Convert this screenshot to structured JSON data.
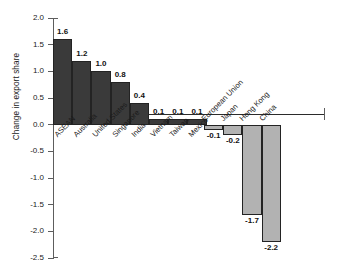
{
  "chart_data": {
    "type": "bar",
    "title": "",
    "subtitle": "",
    "xlabel": "",
    "ylabel": "Change in export share",
    "ylim": [
      -2.5,
      2.0
    ],
    "grid": false,
    "legend": "none",
    "orientation": "vertical",
    "value_label_precision": 1,
    "categories": [
      "ASEAN",
      "Australia",
      "United States",
      "Singapore",
      "India",
      "Vietnam",
      "Taiwan",
      "Mexico",
      "European Union",
      "Japan",
      "Hong Kong",
      "China"
    ],
    "values": [
      1.6,
      1.2,
      1.0,
      0.8,
      0.4,
      0.1,
      0.1,
      0.1,
      -0.1,
      -0.2,
      -1.7,
      -2.2
    ],
    "value_labels": [
      "1.6",
      "1.2",
      "1.0",
      "0.8",
      "0.4",
      "0.1",
      "0.1",
      "0.1",
      "-0.1",
      "-0.2",
      "-1.7",
      "-2.2"
    ],
    "yticks": [
      2.0,
      1.5,
      1.0,
      0.5,
      0.0,
      -0.5,
      -1.0,
      -1.5,
      -2.0,
      -2.5
    ],
    "ytick_labels": [
      "2.0",
      "1.5",
      "1.0",
      "0.5",
      "0.0",
      "-0.5",
      "-1.0",
      "-1.5",
      "-2.0",
      "-2.5"
    ],
    "colors": {
      "positive_bar": "#3a3a3a",
      "negative_bar": "#b2b2b2",
      "bar_outline": "#232323",
      "axis": "#5d5d5d",
      "zero_line": "#2b2b2b",
      "text": "#1a1a1a",
      "background": "#ffffff"
    }
  }
}
